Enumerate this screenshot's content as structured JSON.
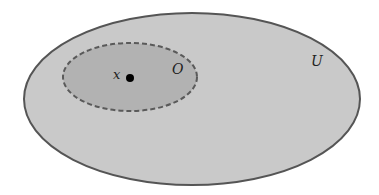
{
  "diagram": {
    "type": "set-diagram",
    "outer_set": {
      "label": "U",
      "fill": "#c9c9c9",
      "stroke": "#555555",
      "style": "solid"
    },
    "inner_set": {
      "label": "O",
      "fill": "#b2b2b2",
      "stroke": "#5a5a5a",
      "style": "dashed"
    },
    "point": {
      "label": "x",
      "color": "#000000"
    }
  }
}
